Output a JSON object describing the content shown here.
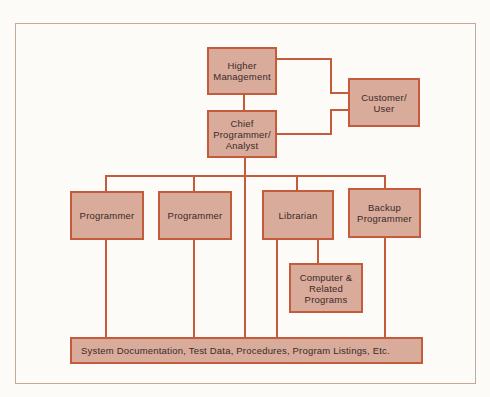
{
  "diagram": {
    "type": "org-chart",
    "nodes": [
      {
        "id": "higher_management",
        "label": "Higher\nManagement"
      },
      {
        "id": "customer_user",
        "label": "Customer/\nUser"
      },
      {
        "id": "chief_programmer",
        "label": "Chief\nProgrammer/\nAnalyst"
      },
      {
        "id": "programmer_1",
        "label": "Programmer"
      },
      {
        "id": "programmer_2",
        "label": "Programmer"
      },
      {
        "id": "librarian",
        "label": "Librarian"
      },
      {
        "id": "backup_programmer",
        "label": "Backup\nProgrammer"
      },
      {
        "id": "computer_programs",
        "label": "Computer &\nRelated\nPrograms"
      },
      {
        "id": "documentation",
        "label": "System Documentation, Test Data, Procedures, Program Listings, Etc."
      }
    ],
    "edges": [
      [
        "higher_management",
        "chief_programmer"
      ],
      [
        "higher_management",
        "customer_user"
      ],
      [
        "chief_programmer",
        "customer_user"
      ],
      [
        "chief_programmer",
        "programmer_1"
      ],
      [
        "chief_programmer",
        "programmer_2"
      ],
      [
        "chief_programmer",
        "librarian"
      ],
      [
        "chief_programmer",
        "backup_programmer"
      ],
      [
        "chief_programmer",
        "documentation"
      ],
      [
        "librarian",
        "computer_programs"
      ],
      [
        "librarian",
        "documentation"
      ],
      [
        "programmer_1",
        "documentation"
      ],
      [
        "programmer_2",
        "documentation"
      ],
      [
        "backup_programmer",
        "documentation"
      ]
    ],
    "colors": {
      "box_fill": "#d8ab9b",
      "line": "#c45c3c",
      "text": "#3b2a28",
      "frame": "#c4a898"
    }
  }
}
